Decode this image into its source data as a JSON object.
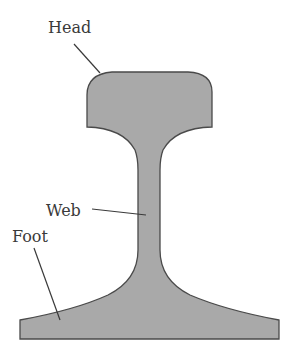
{
  "diagram": {
    "fill_color": "#a9a9a9",
    "outline_color": "#4a4a4a",
    "label_color": "#3a3a3a",
    "labels": [
      {
        "id": "head",
        "text": "Head"
      },
      {
        "id": "web",
        "text": "Web"
      },
      {
        "id": "foot",
        "text": "Foot"
      }
    ]
  }
}
